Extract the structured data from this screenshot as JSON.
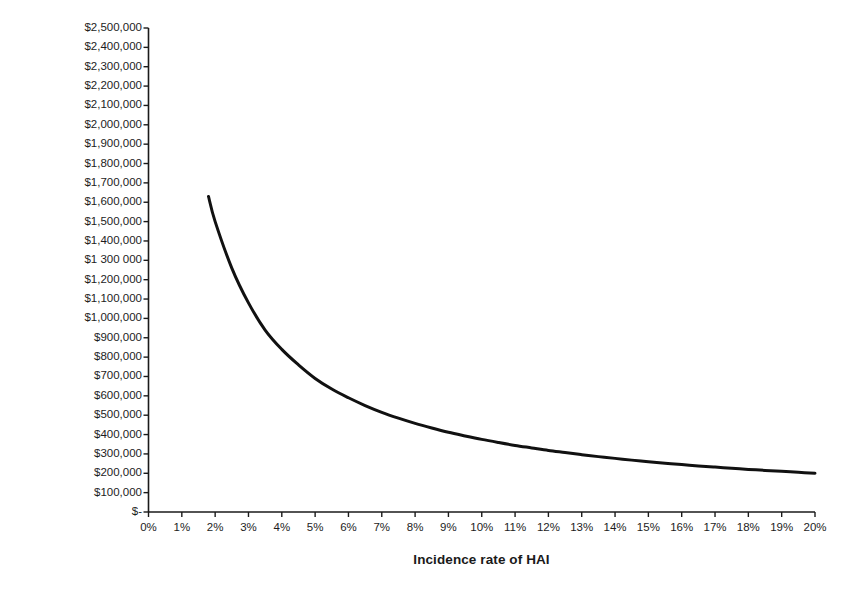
{
  "chart_data": {
    "type": "line",
    "title": "",
    "xlabel": "Incidence rate of HAI",
    "ylabel": "Expenditures on infection control",
    "xlim": [
      0,
      20
    ],
    "ylim": [
      0,
      2500000
    ],
    "grid": false,
    "legend": "none",
    "x_unit": "percent",
    "y_unit": "USD",
    "xtick_labels": [
      "0%",
      "1%",
      "2%",
      "3%",
      "4%",
      "5%",
      "6%",
      "7%",
      "8%",
      "9%",
      "10%",
      "11%",
      "12%",
      "13%",
      "14%",
      "15%",
      "16%",
      "17%",
      "18%",
      "19%",
      "20%"
    ],
    "xtick_values": [
      0,
      1,
      2,
      3,
      4,
      5,
      6,
      7,
      8,
      9,
      10,
      11,
      12,
      13,
      14,
      15,
      16,
      17,
      18,
      19,
      20
    ],
    "ytick_labels": [
      "$2,500,000",
      "$2,400,000",
      "$2,300,000",
      "$2,200,000",
      "$2,100,000",
      "$2,000,000",
      "$1,900,000",
      "$1,800,000",
      "$1,700,000",
      "$1,600,000",
      "$1,500,000",
      "$1,400,000",
      "$1 300 000",
      "$1,200,000",
      "$1,100,000",
      "$1,000,000",
      "$900,000",
      "$800,000",
      "$700,000",
      "$600,000",
      "$500,000",
      "$400,000",
      "$300,000",
      "$200,000",
      "$100,000",
      "$-"
    ],
    "ytick_values": [
      2500000,
      2400000,
      2300000,
      2200000,
      2100000,
      2000000,
      1900000,
      1800000,
      1700000,
      1600000,
      1500000,
      1400000,
      1300000,
      1200000,
      1100000,
      1000000,
      900000,
      800000,
      700000,
      600000,
      500000,
      400000,
      300000,
      200000,
      100000,
      0
    ],
    "series": [
      {
        "name": "Expenditures on infection control",
        "color": "#111111",
        "line_width": 3,
        "x": [
          1.8,
          2,
          2.5,
          3,
          3.5,
          4,
          4.5,
          5,
          5.5,
          6,
          6.5,
          7,
          7.5,
          8,
          8.5,
          9,
          9.5,
          10,
          10.5,
          11,
          11.5,
          12,
          12.5,
          13,
          13.5,
          14,
          14.5,
          15,
          15.5,
          16,
          16.5,
          17,
          17.5,
          18,
          18.5,
          19,
          19.5,
          20
        ],
        "y": [
          1630000,
          1500000,
          1260000,
          1080000,
          940000,
          840000,
          760000,
          690000,
          635000,
          590000,
          550000,
          515000,
          485000,
          458000,
          434000,
          412000,
          393000,
          375000,
          359000,
          344000,
          331000,
          318000,
          307000,
          296000,
          286000,
          277000,
          268000,
          260000,
          252000,
          245000,
          238000,
          232000,
          226000,
          220000,
          215000,
          210000,
          205000,
          200000
        ]
      }
    ]
  }
}
